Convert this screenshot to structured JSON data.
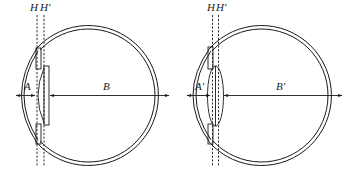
{
  "figure": {
    "colors": {
      "line": "#1a1a1a",
      "background": "#ffffff"
    }
  },
  "left_eye": {
    "plane_labels": {
      "H": "H",
      "H_prime": "H'"
    },
    "anterior_distance_label": "A",
    "posterior_distance_label": "B",
    "lens_shape": "plano-convex"
  },
  "right_eye": {
    "plane_labels": {
      "H": "H",
      "H_prime": "H'"
    },
    "anterior_distance_label": "A'",
    "posterior_distance_label": "B'",
    "lens_shape": "biconvex"
  }
}
